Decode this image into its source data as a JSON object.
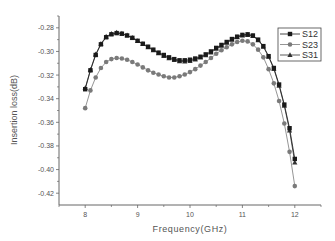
{
  "chart_data": {
    "type": "line",
    "title": "",
    "xlabel": "Frequency(GHz)",
    "ylabel": "Insertion loss(dB)",
    "xlim": [
      7.5,
      12.5
    ],
    "ylim": [
      -0.43,
      -0.27
    ],
    "xticks": [
      8,
      9,
      10,
      11,
      12
    ],
    "xtick_labels": [
      "8",
      "9",
      "10",
      "11",
      "12"
    ],
    "yticks": [
      -0.28,
      -0.3,
      -0.32,
      -0.34,
      -0.36,
      -0.38,
      -0.4,
      -0.42
    ],
    "ytick_labels": [
      "-0.28",
      "-0.30",
      "-0.32",
      "-0.34",
      "-0.36",
      "-0.38",
      "-0.40",
      "-0.42"
    ],
    "grid": false,
    "legend_position": "top-right",
    "x": [
      8.0,
      8.1,
      8.2,
      8.3,
      8.4,
      8.5,
      8.6,
      8.7,
      8.8,
      8.9,
      9.0,
      9.1,
      9.2,
      9.3,
      9.4,
      9.5,
      9.6,
      9.7,
      9.8,
      9.9,
      10.0,
      10.1,
      10.2,
      10.3,
      10.4,
      10.5,
      10.6,
      10.7,
      10.8,
      10.9,
      11.0,
      11.1,
      11.2,
      11.3,
      11.4,
      11.5,
      11.6,
      11.7,
      11.8,
      11.9,
      12.0
    ],
    "series": [
      {
        "name": "S12",
        "marker": "square",
        "color": "#1a1a1a",
        "values": [
          -0.332,
          -0.316,
          -0.303,
          -0.294,
          -0.288,
          -0.2855,
          -0.2845,
          -0.285,
          -0.2865,
          -0.2885,
          -0.291,
          -0.2935,
          -0.296,
          -0.2985,
          -0.301,
          -0.303,
          -0.305,
          -0.3065,
          -0.3075,
          -0.3075,
          -0.307,
          -0.306,
          -0.3045,
          -0.3025,
          -0.3,
          -0.297,
          -0.2945,
          -0.292,
          -0.2895,
          -0.2875,
          -0.286,
          -0.2855,
          -0.2865,
          -0.29,
          -0.2955,
          -0.304,
          -0.314,
          -0.328,
          -0.345,
          -0.365,
          -0.391
        ]
      },
      {
        "name": "S23",
        "marker": "circle",
        "color": "#7a7a7a",
        "values": [
          -0.348,
          -0.333,
          -0.322,
          -0.314,
          -0.309,
          -0.3065,
          -0.3055,
          -0.306,
          -0.307,
          -0.309,
          -0.311,
          -0.3135,
          -0.316,
          -0.318,
          -0.3195,
          -0.321,
          -0.322,
          -0.322,
          -0.321,
          -0.3195,
          -0.3175,
          -0.315,
          -0.312,
          -0.309,
          -0.3055,
          -0.302,
          -0.299,
          -0.2965,
          -0.294,
          -0.292,
          -0.291,
          -0.2915,
          -0.294,
          -0.2985,
          -0.305,
          -0.315,
          -0.327,
          -0.342,
          -0.361,
          -0.385,
          -0.414
        ]
      },
      {
        "name": "S31",
        "marker": "triangle",
        "color": "#333333",
        "values": [
          -0.331,
          -0.3155,
          -0.3025,
          -0.2935,
          -0.2875,
          -0.285,
          -0.284,
          -0.2848,
          -0.2863,
          -0.2885,
          -0.2912,
          -0.2938,
          -0.2965,
          -0.299,
          -0.3015,
          -0.3038,
          -0.3058,
          -0.3073,
          -0.3083,
          -0.3085,
          -0.308,
          -0.3068,
          -0.3052,
          -0.3032,
          -0.3008,
          -0.2978,
          -0.2952,
          -0.2926,
          -0.2902,
          -0.288,
          -0.2865,
          -0.286,
          -0.287,
          -0.2905,
          -0.296,
          -0.3045,
          -0.3148,
          -0.329,
          -0.346,
          -0.367,
          -0.394
        ]
      }
    ]
  }
}
